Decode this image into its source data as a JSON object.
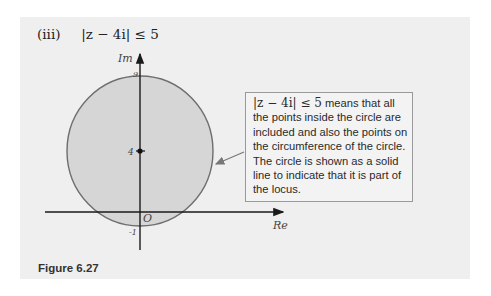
{
  "heading": {
    "part_label": "(iii)",
    "expression": "|z − 4i| ≤ 5"
  },
  "diagram": {
    "y_axis_label": "Im",
    "x_axis_label": "Re",
    "top_tick_label": "9",
    "center_tick_label": "4",
    "origin_label": "O",
    "bottom_tick_label": "-1",
    "circle": {
      "center_im": 4,
      "radius": 5,
      "fill": "#d6d6d6",
      "stroke": "#6e6e6e",
      "boundary": "solid"
    }
  },
  "callout": {
    "math": "|z − 4i| ≤ 5",
    "text": "means that all the points inside the circle are included and also the points on the circumference of the circle. The circle is shown as a solid line to indicate that it is part of the locus."
  },
  "caption": "Figure 6.27"
}
